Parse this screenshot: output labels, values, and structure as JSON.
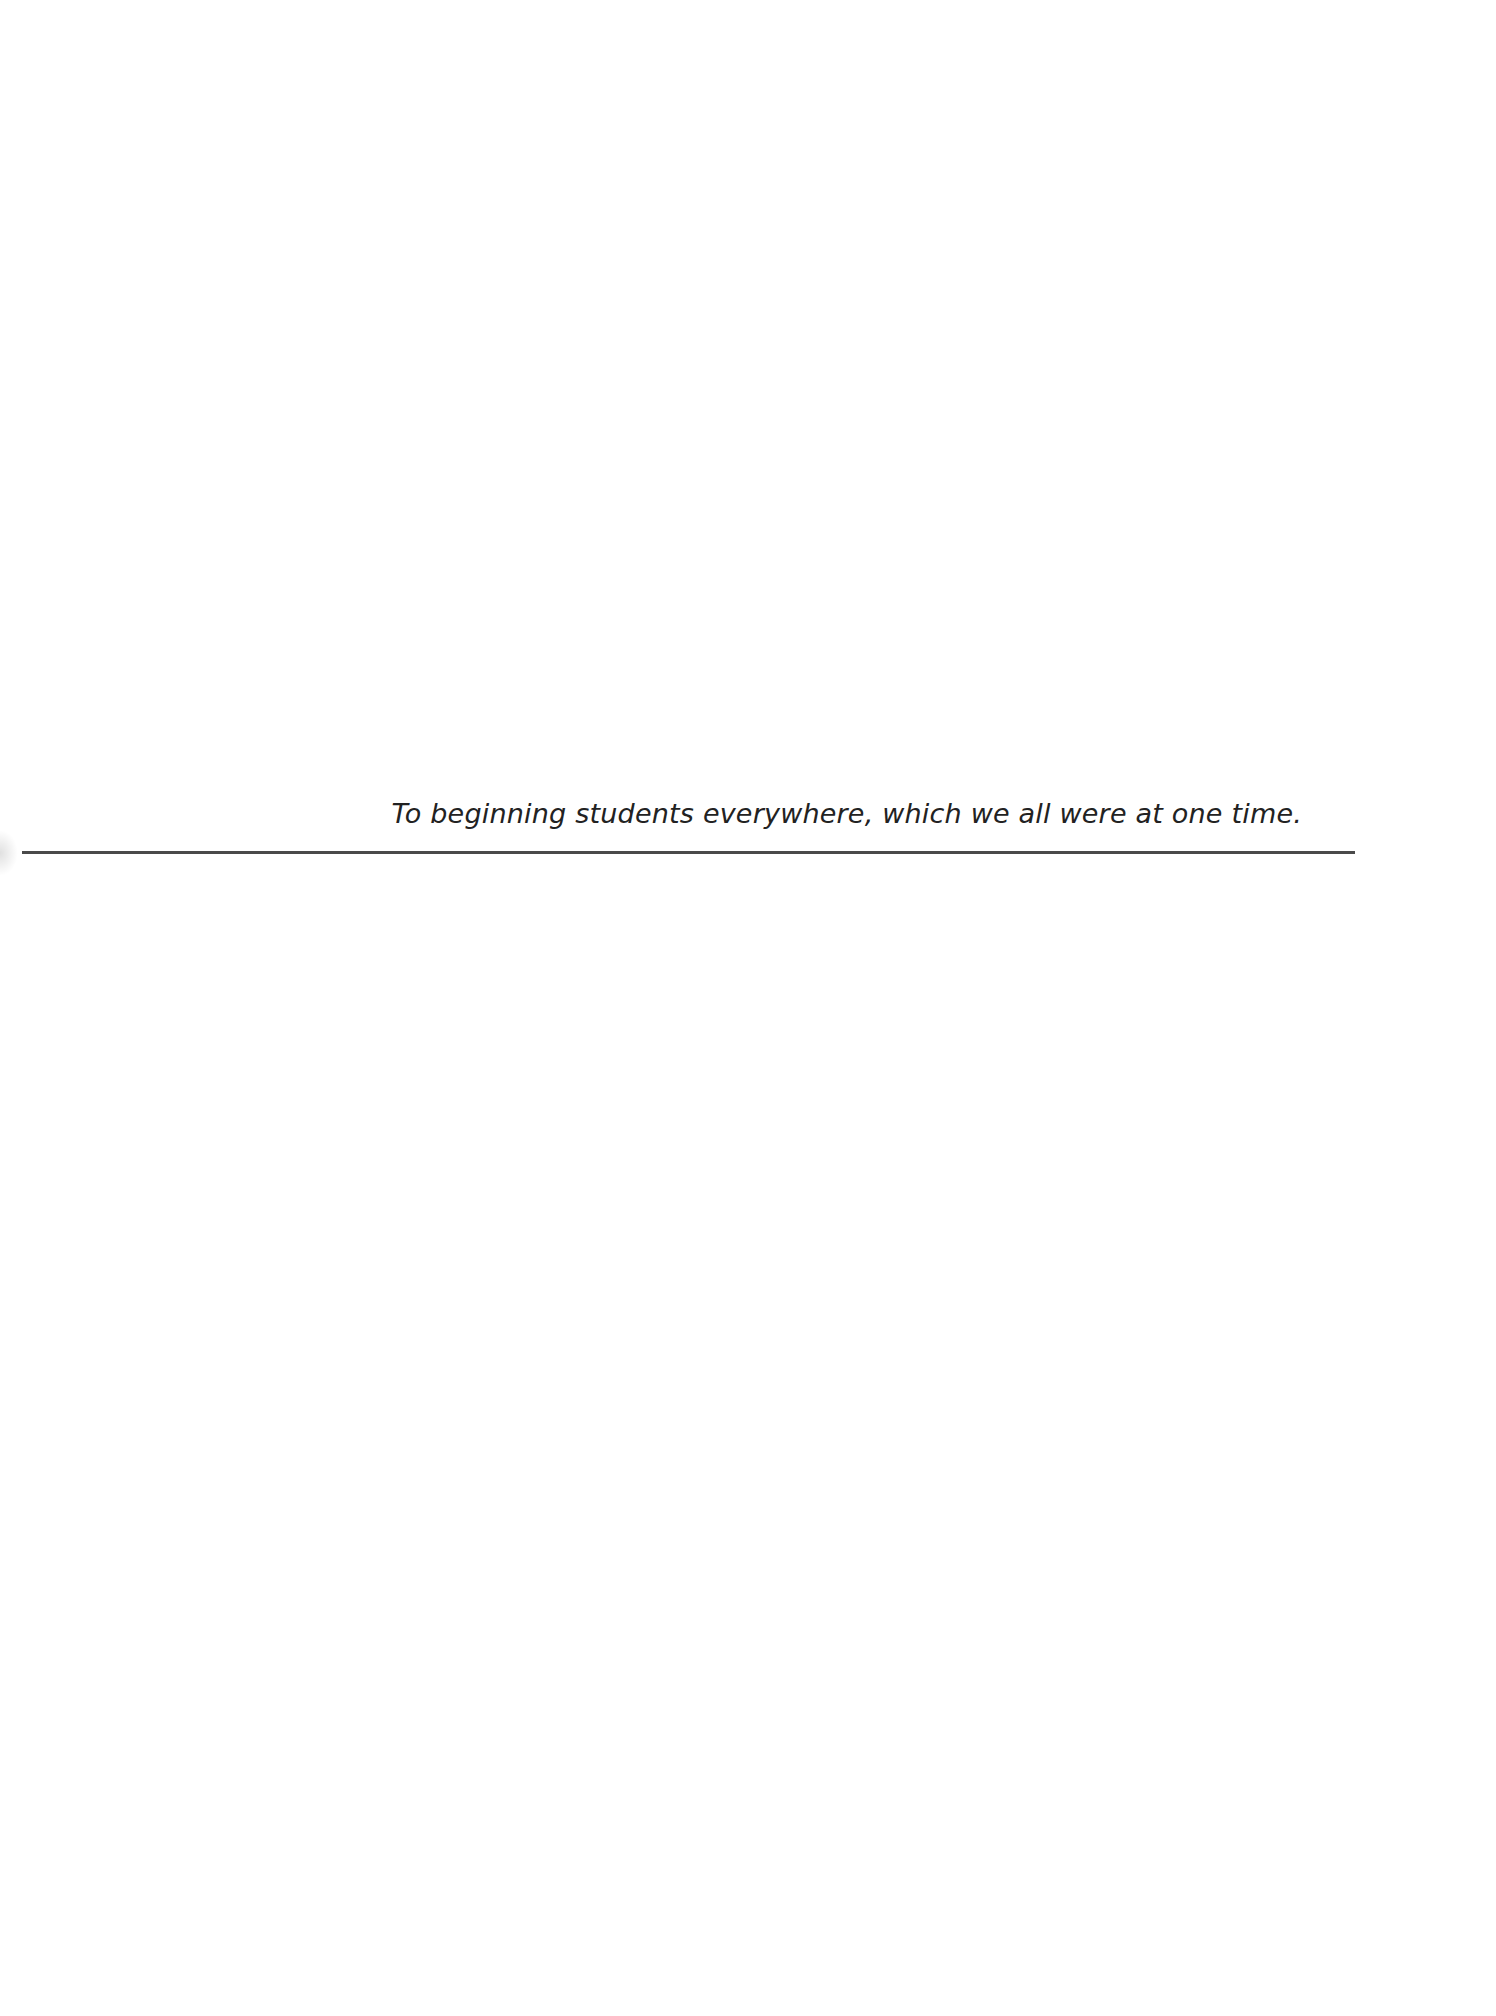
{
  "page": {
    "type": "dedication",
    "dedication_text": "To beginning students everywhere, which we all were at one time."
  }
}
